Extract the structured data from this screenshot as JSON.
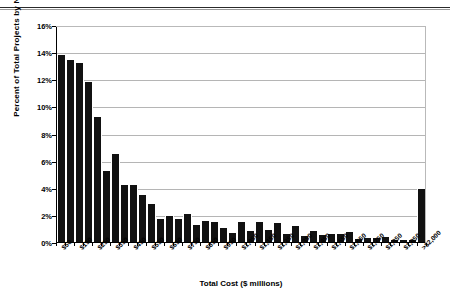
{
  "chart_data": {
    "type": "bar",
    "title": "",
    "xlabel": "Total Cost ($ millions)",
    "ylabel": "Percent of Total Projects by Number",
    "ylim": [
      0,
      16
    ],
    "ytick_labels": [
      "16%",
      "14%",
      "12%",
      "10%",
      "8%",
      "6%",
      "4%",
      "2%",
      "0%"
    ],
    "ytick_values": [
      16,
      14,
      12,
      10,
      8,
      6,
      4,
      2,
      0
    ],
    "grid": true,
    "legend": null,
    "bar_color": "#111111",
    "categories": [
      "$50",
      "$100",
      "$150",
      "$200",
      "$250",
      "$300",
      "$350",
      "$400",
      "$450",
      "$500",
      "$550",
      "$600",
      "$650",
      "$700",
      "$750",
      "$800",
      "$850",
      "$900",
      "$950",
      "$1,000",
      "$1,050",
      "$1,100",
      "$1,150",
      "$1,200",
      "$1,250",
      "$1,300",
      "$1,350",
      "$1,400",
      "$1,450",
      "$1,500",
      "$1,550",
      "$1,600",
      "$1,650",
      "$1,700",
      "$1,750",
      "$1,800",
      "$1,850",
      "$1,900",
      "$1,950",
      "$2,000",
      ">$2,000"
    ],
    "values": [
      13.8,
      13.4,
      13.2,
      11.8,
      9.2,
      5.2,
      6.5,
      4.2,
      4.2,
      3.5,
      2.8,
      1.7,
      1.9,
      1.7,
      2.05,
      1.25,
      1.55,
      1.5,
      1.05,
      0.7,
      1.5,
      0.8,
      1.45,
      0.9,
      1.4,
      0.6,
      1.15,
      0.45,
      0.8,
      0.5,
      0.6,
      0.6,
      0.75,
      0.2,
      0.3,
      0.3,
      0.35,
      0.12,
      0.18,
      0.15,
      3.9
    ],
    "xtick_labels": [
      "$50",
      "$150",
      "$250",
      "$350",
      "$450",
      "$550",
      "$650",
      "$750",
      "$850",
      "$950",
      "$1,050",
      "$1,150",
      "$1,250",
      "$1,350",
      "$1,450",
      "$1,550",
      "$1,650",
      "$1,750",
      "$1,850",
      "$1,950",
      ">$2,000"
    ],
    "xtick_indices": [
      0,
      2,
      4,
      6,
      8,
      10,
      12,
      14,
      16,
      18,
      20,
      22,
      24,
      26,
      28,
      30,
      32,
      34,
      36,
      38,
      40
    ]
  }
}
